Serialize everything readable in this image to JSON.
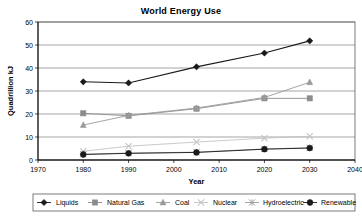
{
  "chart_data": {
    "type": "line",
    "title": "World Energy Use",
    "xlabel": "Year",
    "ylabel": "Quadrillion kJ",
    "xlim": [
      1970,
      2040
    ],
    "ylim": [
      0,
      60
    ],
    "xticks": [
      1970,
      1980,
      1990,
      2000,
      2010,
      2020,
      2030,
      2040
    ],
    "yticks": [
      0,
      10,
      20,
      30,
      40,
      50,
      60
    ],
    "grid": "horizontal",
    "legend_position": "bottom",
    "x": [
      1980,
      1990,
      2005,
      2020,
      2030
    ],
    "series": [
      {
        "name": "Liquids",
        "marker": "diamond",
        "color": "#1a1a1a",
        "values": [
          34,
          33.5,
          40.5,
          46.5,
          51.8
        ]
      },
      {
        "name": "Natural Gas",
        "marker": "square",
        "color": "#8c8c8c",
        "values": [
          20.3,
          19.2,
          22.3,
          26.8,
          26.8
        ]
      },
      {
        "name": "Coal",
        "marker": "triangle",
        "color": "#9a9a9a",
        "values": [
          15.2,
          19.4,
          22.6,
          27.2,
          33.8
        ]
      },
      {
        "name": "Nuclear",
        "marker": "cross",
        "color": "#c4c4c4",
        "values": [
          3.8,
          6.0,
          7.8,
          9.5,
          10.3
        ]
      },
      {
        "name": "Hydroelectric",
        "marker": "asterisk",
        "color": "#9e9e9e",
        "values": [
          2.5,
          3.0,
          3.4,
          4.8,
          5.3
        ]
      },
      {
        "name": "Renewable",
        "marker": "circle",
        "color": "#1a1a1a",
        "values": [
          2.4,
          2.9,
          3.3,
          4.7,
          5.2
        ]
      }
    ]
  }
}
